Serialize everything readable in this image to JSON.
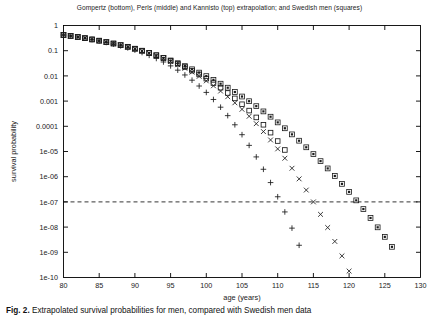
{
  "figure": {
    "title": "Gompertz (bottom), Perls (middle) and Kannisto (top) extrapolation; and Swedish men (squares)",
    "caption_label": "Fig. 2.",
    "caption_text": "Extrapolated survival probabilities for men, compared with Swedish men data"
  },
  "chart_data": {
    "type": "scatter",
    "title": "Gompertz (bottom), Perls (middle) and Kannisto (top) extrapolation; and Swedish men (squares)",
    "xlabel": "age (years)",
    "ylabel": "survival probability",
    "xlim": [
      80,
      130
    ],
    "ylim": [
      1e-10,
      1
    ],
    "yscale": "log",
    "xscale": "linear",
    "xticks": [
      80,
      85,
      90,
      95,
      100,
      105,
      110,
      115,
      120,
      125,
      130
    ],
    "xticklabels": [
      "80",
      "85",
      "90",
      "95",
      "100",
      "105",
      "110",
      "115",
      "120",
      "125",
      "130"
    ],
    "yticks": [
      1,
      0.1,
      0.01,
      0.001,
      0.0001,
      1e-05,
      1e-06,
      1e-07,
      1e-08,
      1e-09,
      1e-10
    ],
    "yticklabels": [
      "1",
      "0.1",
      "0.01",
      "0.001",
      "0.0001",
      "1e-05",
      "1e-06",
      "1e-07",
      "1e-08",
      "1e-09",
      "1e-10"
    ],
    "grid": false,
    "legend_position": "none",
    "annotations": [
      {
        "kind": "hline",
        "label": "reference level 1e-07",
        "y": 1e-07,
        "style": "dashed"
      }
    ],
    "series": [
      {
        "name": "Swedish men (squares)",
        "marker": "square-open",
        "color": "#1a1a1a",
        "x": [
          80,
          81,
          82,
          83,
          84,
          85,
          86,
          87,
          88,
          89,
          90,
          91,
          92,
          93,
          94,
          95,
          96,
          97,
          98,
          99,
          100,
          101,
          102,
          103,
          104,
          105,
          106,
          107,
          108,
          109,
          110,
          111
        ],
        "y": [
          0.42,
          0.385,
          0.35,
          0.315,
          0.28,
          0.25,
          0.22,
          0.193,
          0.167,
          0.143,
          0.12,
          0.1,
          0.082,
          0.066,
          0.052,
          0.04,
          0.03,
          0.0225,
          0.0162,
          0.0114,
          0.0078,
          0.0052,
          0.0034,
          0.0021,
          0.00128,
          0.00075,
          0.00042,
          0.000225,
          0.000115,
          5.6e-05,
          2.6e-05,
          1.15e-05
        ]
      },
      {
        "name": "Kannisto extrapolation (top)",
        "marker": "square-filled",
        "color": "#1a1a1a",
        "x": [
          80,
          81,
          82,
          83,
          84,
          85,
          86,
          87,
          88,
          89,
          90,
          91,
          92,
          93,
          94,
          95,
          96,
          97,
          98,
          99,
          100,
          101,
          102,
          103,
          104,
          105,
          106,
          107,
          108,
          109,
          110,
          111,
          112,
          113,
          114,
          115,
          116,
          117,
          118,
          119,
          120,
          121,
          122,
          123,
          124,
          125,
          126
        ],
        "y": [
          0.42,
          0.385,
          0.35,
          0.315,
          0.28,
          0.25,
          0.22,
          0.193,
          0.167,
          0.143,
          0.12,
          0.1,
          0.082,
          0.066,
          0.052,
          0.041,
          0.032,
          0.0245,
          0.0183,
          0.0135,
          0.0098,
          0.007,
          0.0049,
          0.0034,
          0.0023,
          0.00152,
          0.00099,
          0.00063,
          0.00039,
          0.00024,
          0.000143,
          8.35e-05,
          4.78e-05,
          2.68e-05,
          1.47e-05,
          7.9e-06,
          4.15e-06,
          2.13e-06,
          1.07e-06,
          5.2e-07,
          2.5e-07,
          1.15e-07,
          5.2e-08,
          2.3e-08,
          9.8e-09,
          4.1e-09,
          1.65e-09
        ]
      },
      {
        "name": "Perls extrapolation (middle)",
        "marker": "x",
        "color": "#1a1a1a",
        "x": [
          80,
          81,
          82,
          83,
          84,
          85,
          86,
          87,
          88,
          89,
          90,
          91,
          92,
          93,
          94,
          95,
          96,
          97,
          98,
          99,
          100,
          101,
          102,
          103,
          104,
          105,
          106,
          107,
          108,
          109,
          110,
          111,
          112,
          113,
          114,
          115,
          116,
          117,
          118,
          119,
          120
        ],
        "y": [
          0.42,
          0.385,
          0.35,
          0.315,
          0.28,
          0.25,
          0.22,
          0.192,
          0.166,
          0.141,
          0.118,
          0.0975,
          0.079,
          0.0628,
          0.0489,
          0.0373,
          0.0277,
          0.02,
          0.0141,
          0.0096,
          0.00635,
          0.00405,
          0.0025,
          0.00149,
          0.000855,
          0.000472,
          0.00025,
          0.000127,
          6.17e-05,
          2.87e-05,
          1.27e-05,
          5.4e-06,
          2.16e-06,
          8.2e-07,
          2.95e-07,
          1e-07,
          3.2e-08,
          9.6e-09,
          2.7e-09,
          7.2e-10,
          1.8e-10
        ]
      },
      {
        "name": "Gompertz extrapolation (bottom)",
        "marker": "plus",
        "color": "#1a1a1a",
        "x": [
          80,
          81,
          82,
          83,
          84,
          85,
          86,
          87,
          88,
          89,
          90,
          91,
          92,
          93,
          94,
          95,
          96,
          97,
          98,
          99,
          100,
          101,
          102,
          103,
          104,
          105,
          106,
          107,
          108,
          109,
          110,
          111,
          112,
          113
        ],
        "y": [
          0.42,
          0.385,
          0.35,
          0.313,
          0.277,
          0.245,
          0.213,
          0.184,
          0.156,
          0.13,
          0.106,
          0.0845,
          0.0655,
          0.0492,
          0.0357,
          0.025,
          0.0169,
          0.0109,
          0.00675,
          0.00397,
          0.00221,
          0.00116,
          0.000573,
          0.000265,
          0.000115,
          4.65e-05,
          1.75e-05,
          6.1e-06,
          1.97e-06,
          5.85e-07,
          1.6e-07,
          4e-08,
          9.1e-09,
          1.9e-09
        ]
      }
    ]
  }
}
